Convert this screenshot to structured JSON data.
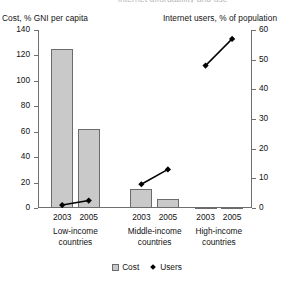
{
  "header": {
    "clipped_title": "internet affordability and use"
  },
  "legend": {
    "position": "bottom-center",
    "items": [
      {
        "label": "Cost",
        "marker": "square-swatch-icon",
        "color": "#c9c9c9"
      },
      {
        "label": "Users",
        "marker": "diamond-marker-icon",
        "color": "#000000"
      }
    ]
  },
  "chart_data": {
    "type": "bar",
    "title": "",
    "categories": [
      "Low-income countries 2003",
      "Low-income countries 2005",
      "Middle-income countries 2003",
      "Middle-income countries 2005",
      "High-income countries 2003",
      "High-income countries 2005"
    ],
    "groups": [
      {
        "name": "Low-income countries",
        "years": [
          "2003",
          "2005"
        ]
      },
      {
        "name": "Middle-income countries",
        "years": [
          "2003",
          "2005"
        ]
      },
      {
        "name": "High-income countries",
        "years": [
          "2003",
          "2005"
        ]
      }
    ],
    "series": [
      {
        "name": "Cost",
        "axis": "left",
        "render": "bar",
        "color": "#c9c9c9",
        "values": [
          125,
          62,
          15,
          7,
          0.5,
          0.4
        ]
      },
      {
        "name": "Users",
        "axis": "right",
        "render": "line-markers",
        "color": "#000000",
        "values": [
          1,
          2.5,
          8,
          13,
          48,
          57
        ]
      }
    ],
    "xlabel": "",
    "ylabel": "Cost, % GNI per capita",
    "y2label": "Internet users, % of population",
    "ylim": [
      0,
      140
    ],
    "y2lim": [
      0,
      60
    ],
    "yticks": [
      0,
      20,
      40,
      60,
      80,
      100,
      120,
      140
    ],
    "y2ticks": [
      0,
      10,
      20,
      30,
      40,
      50,
      60
    ],
    "grid": false
  }
}
